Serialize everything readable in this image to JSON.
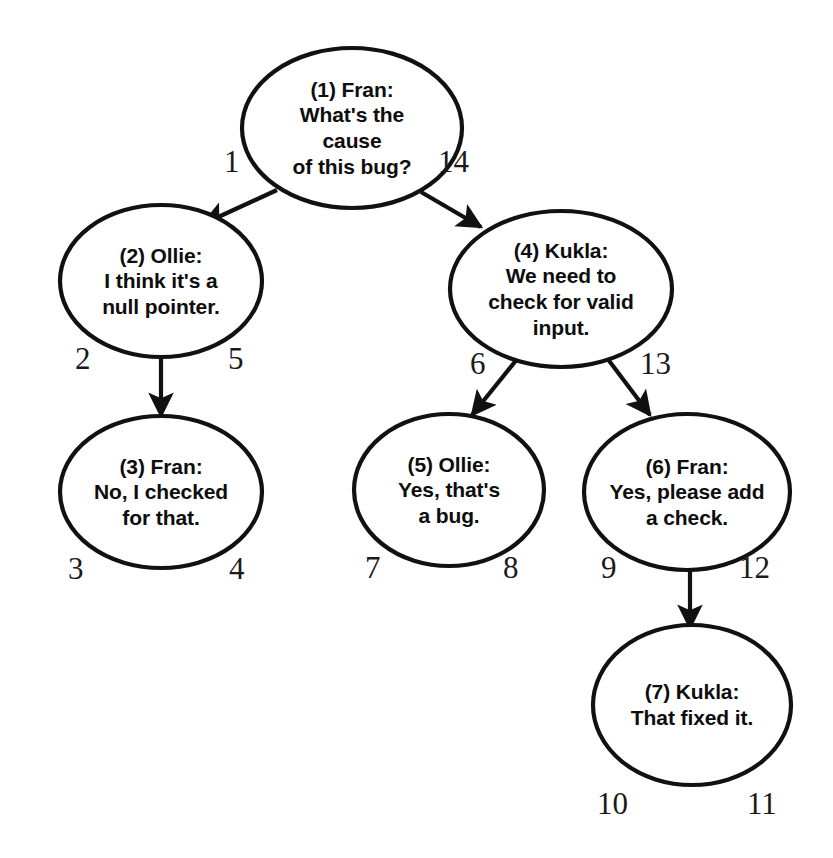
{
  "diagram": {
    "background_color": "#ffffff",
    "stroke_color": "#111111",
    "text_color": "#0d0d0d",
    "nodes": [
      {
        "id": "n1",
        "number": "(1)",
        "speaker": "Fran",
        "header": "(1) Fran:",
        "body": "What's the\ncause\nof this bug?",
        "text": "(1) Fran:\nWhat's the\ncause\nof this bug?",
        "cx": 352,
        "cy": 128,
        "rx": 110,
        "ry": 80,
        "font_size": 21
      },
      {
        "id": "n2",
        "number": "(2)",
        "speaker": "Ollie",
        "header": "(2) Ollie:",
        "body": "I think it's a\nnull pointer.",
        "text": "(2) Ollie:\nI think it's a\nnull pointer.",
        "cx": 161,
        "cy": 281,
        "rx": 101,
        "ry": 76,
        "font_size": 21
      },
      {
        "id": "n3",
        "number": "(3)",
        "speaker": "Fran",
        "header": "(3) Fran:",
        "body": "No, I checked\nfor that.",
        "text": "(3) Fran:\nNo, I checked\nfor that.",
        "cx": 161,
        "cy": 492,
        "rx": 101,
        "ry": 76,
        "font_size": 21
      },
      {
        "id": "n4",
        "number": "(4)",
        "speaker": "Kukla",
        "header": "(4) Kukla:",
        "body": "We need to\ncheck for valid\ninput.",
        "text": "(4) Kukla:\nWe need to\ncheck for valid\ninput.",
        "cx": 561,
        "cy": 289,
        "rx": 111,
        "ry": 78,
        "font_size": 21
      },
      {
        "id": "n5",
        "number": "(5)",
        "speaker": "Ollie",
        "header": "(5) Ollie:",
        "body": "Yes, that's\na bug.",
        "text": "(5) Ollie:\nYes, that's\na bug.",
        "cx": 449,
        "cy": 490,
        "rx": 95,
        "ry": 76,
        "font_size": 21
      },
      {
        "id": "n6",
        "number": "(6)",
        "speaker": "Fran",
        "header": "(6) Fran:",
        "body": "Yes, please add\na check.",
        "text": "(6) Fran:\nYes, please add\na check.",
        "cx": 687,
        "cy": 492,
        "rx": 103,
        "ry": 78,
        "font_size": 21
      },
      {
        "id": "n7",
        "number": "(7)",
        "speaker": "Kukla",
        "header": "(7) Kukla:",
        "body": "That fixed it.",
        "text": "(7) Kukla:\nThat fixed it.",
        "cx": 692,
        "cy": 705,
        "rx": 99,
        "ry": 80,
        "font_size": 21
      }
    ],
    "edges": [
      {
        "id": "e1",
        "from": "n1",
        "to": "n2",
        "x1": 277,
        "y1": 190,
        "x2": 203,
        "y2": 224,
        "enter_label": "1",
        "exit_label": "2"
      },
      {
        "id": "e2",
        "from": "n1",
        "to": "n4",
        "x1": 421,
        "y1": 192,
        "x2": 481,
        "y2": 227,
        "enter_label": "14",
        "exit_label": "13"
      },
      {
        "id": "e3",
        "from": "n2",
        "to": "n3",
        "x1": 161,
        "y1": 357,
        "x2": 161,
        "y2": 416,
        "enter_label": "2",
        "exit_label": "3"
      },
      {
        "id": "e4",
        "from": "n4",
        "to": "n5",
        "x1": 518,
        "y1": 358,
        "x2": 472,
        "y2": 415,
        "enter_label": "6",
        "exit_label": "7"
      },
      {
        "id": "e5",
        "from": "n4",
        "to": "n6",
        "x1": 607,
        "y1": 358,
        "x2": 650,
        "y2": 415,
        "enter_label": "13",
        "exit_label": "9"
      },
      {
        "id": "e6",
        "from": "n6",
        "to": "n7",
        "x1": 690,
        "y1": 570,
        "x2": 690,
        "y2": 628,
        "enter_label": "9",
        "exit_label": "10"
      }
    ],
    "edge_labels": [
      {
        "id": "lbl-1",
        "text": "1",
        "x": 224,
        "y": 146,
        "font_size": 31
      },
      {
        "id": "lbl-14",
        "text": "14",
        "x": 438,
        "y": 146,
        "font_size": 31
      },
      {
        "id": "lbl-2",
        "text": "2",
        "x": 75,
        "y": 343,
        "font_size": 31
      },
      {
        "id": "lbl-5",
        "text": "5",
        "x": 228,
        "y": 343,
        "font_size": 31
      },
      {
        "id": "lbl-3",
        "text": "3",
        "x": 68,
        "y": 553,
        "font_size": 31
      },
      {
        "id": "lbl-4",
        "text": "4",
        "x": 229,
        "y": 553,
        "font_size": 31
      },
      {
        "id": "lbl-6",
        "text": "6",
        "x": 470,
        "y": 348,
        "font_size": 31
      },
      {
        "id": "lbl-13",
        "text": "13",
        "x": 640,
        "y": 348,
        "font_size": 31
      },
      {
        "id": "lbl-7",
        "text": "7",
        "x": 365,
        "y": 552,
        "font_size": 31
      },
      {
        "id": "lbl-8",
        "text": "8",
        "x": 503,
        "y": 552,
        "font_size": 31
      },
      {
        "id": "lbl-9",
        "text": "9",
        "x": 601,
        "y": 552,
        "font_size": 31
      },
      {
        "id": "lbl-12",
        "text": "12",
        "x": 739,
        "y": 552,
        "font_size": 31
      },
      {
        "id": "lbl-10",
        "text": "10",
        "x": 597,
        "y": 788,
        "font_size": 31
      },
      {
        "id": "lbl-11",
        "text": "11",
        "x": 747,
        "y": 788,
        "font_size": 31
      }
    ]
  },
  "chart_data": {
    "type": "diagram",
    "subtype": "directed-tree",
    "nodes": [
      {
        "id": 1,
        "label": "(1) Fran: What's the cause of this bug?"
      },
      {
        "id": 2,
        "label": "(2) Ollie: I think it's a null pointer."
      },
      {
        "id": 3,
        "label": "(3) Fran: No, I checked for that."
      },
      {
        "id": 4,
        "label": "(4) Kukla: We need to check for valid input."
      },
      {
        "id": 5,
        "label": "(5) Ollie: Yes, that's a bug."
      },
      {
        "id": 6,
        "label": "(6) Fran: Yes, please add a check."
      },
      {
        "id": 7,
        "label": "(7) Kukla: That fixed it."
      }
    ],
    "links": [
      {
        "from": 1,
        "to": 2
      },
      {
        "from": 1,
        "to": 4
      },
      {
        "from": 2,
        "to": 3
      },
      {
        "from": 4,
        "to": 5
      },
      {
        "from": 4,
        "to": 6
      },
      {
        "from": 6,
        "to": 7
      }
    ],
    "traversal_numbers": [
      1,
      2,
      3,
      4,
      5,
      6,
      7,
      8,
      9,
      10,
      11,
      12,
      13,
      14
    ]
  }
}
